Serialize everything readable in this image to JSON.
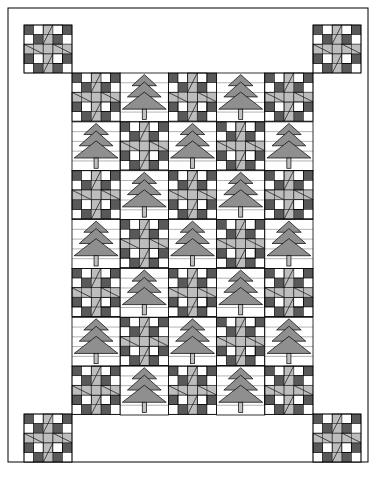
{
  "document": {
    "title": "Christmas Tree and Star Quilt Block Layout",
    "type": "quilt-pattern-diagram"
  },
  "canvas": {
    "width": 376,
    "height": 478,
    "background": "#ffffff"
  },
  "palette": {
    "background": "#ffffff",
    "outline": "#000000",
    "seam_line": "#808080",
    "dark_patch": "#595959",
    "light_patch": "#bdbdbd",
    "tree_foliage": "#8f8f8f",
    "tree_trunk": "#c0c0c0",
    "star_center": "#bdbdbd",
    "star_point": "#bdbdbd"
  },
  "frame": {
    "x": 8,
    "y": 8,
    "width": 360,
    "height": 454,
    "stroke": "#000000",
    "stroke_width": 1,
    "fill": "#ffffff"
  },
  "inner_grid": {
    "x": 72,
    "y": 73,
    "width": 241,
    "height": 342,
    "columns": 5,
    "rows": 7,
    "cell_width": 48.2,
    "cell_height": 48.857,
    "layout": [
      [
        "star",
        "tree",
        "star",
        "tree",
        "star"
      ],
      [
        "tree",
        "star",
        "tree",
        "star",
        "tree"
      ],
      [
        "star",
        "tree",
        "star",
        "tree",
        "star"
      ],
      [
        "tree",
        "star",
        "tree",
        "star",
        "tree"
      ],
      [
        "star",
        "tree",
        "star",
        "tree",
        "star"
      ],
      [
        "tree",
        "star",
        "tree",
        "star",
        "tree"
      ],
      [
        "star",
        "tree",
        "star",
        "tree",
        "star"
      ]
    ]
  },
  "corner_blocks": {
    "size": 48,
    "positions": [
      {
        "name": "top-left",
        "x": 24,
        "y": 25
      },
      {
        "name": "top-right",
        "x": 313,
        "y": 25
      },
      {
        "name": "bottom-left",
        "x": 24,
        "y": 414
      },
      {
        "name": "bottom-right",
        "x": 313,
        "y": 414
      }
    ]
  },
  "star_block": {
    "name": "sawtooth-star-with-checkerboard-corners",
    "grid": 5,
    "center_fill": "#bdbdbd",
    "point_fill": "#bdbdbd",
    "checker_dark": "#595959",
    "checker_light": "#ffffff"
  },
  "tree_block": {
    "name": "christmas-tree",
    "tiers": 3,
    "foliage_fill": "#8f8f8f",
    "trunk_fill": "#c0c0c0",
    "seam_rows": 5
  },
  "counts": {
    "star_blocks_total": 22,
    "tree_blocks_total": 17,
    "corner_star_blocks": 4,
    "grid_blocks": 35
  }
}
